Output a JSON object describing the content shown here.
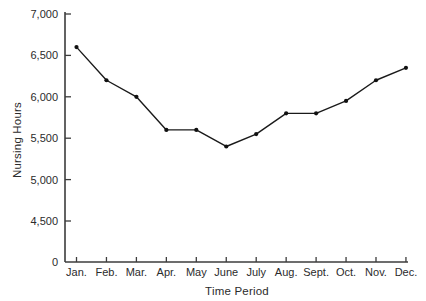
{
  "chart_data": {
    "type": "line",
    "title": "",
    "xlabel": "Time Period",
    "ylabel": "Nursing Hours",
    "categories": [
      "Jan.",
      "Feb.",
      "Mar.",
      "Apr.",
      "May",
      "June",
      "July",
      "Aug.",
      "Sept.",
      "Oct.",
      "Nov.",
      "Dec."
    ],
    "values": [
      6600,
      6200,
      6000,
      5600,
      5600,
      5400,
      5550,
      5800,
      5800,
      5950,
      6200,
      6350
    ],
    "series_name": "Nursing Hours",
    "y_ticks": [
      {
        "label": "7,000",
        "value": 7000
      },
      {
        "label": "6,500",
        "value": 6500
      },
      {
        "label": "6,000",
        "value": 6000
      },
      {
        "label": "5,500",
        "value": 5500
      },
      {
        "label": "5,000",
        "value": 5000
      },
      {
        "label": "4,500",
        "value": 4500
      },
      {
        "label": "0",
        "value": 0
      }
    ],
    "axis_break_between_0_and_4500": true,
    "ylim_display": [
      4500,
      7000
    ],
    "grid": false,
    "legend": false,
    "marker": "dot",
    "colors": {
      "line": "#1a1a1a",
      "marker": "#111111",
      "axis": "#3c3c3c",
      "text": "#2b2b2b",
      "background": "#ffffff"
    }
  }
}
